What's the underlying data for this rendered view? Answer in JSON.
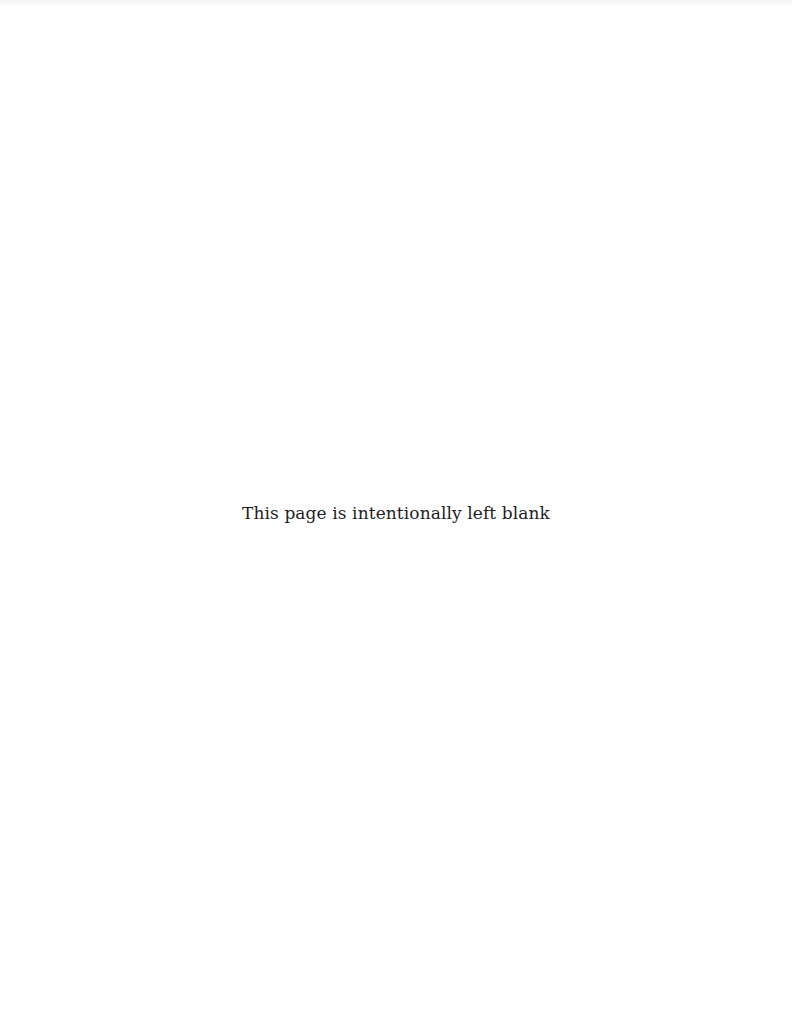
{
  "page": {
    "notice": "This page is intentionally left blank",
    "background_color": "#fefefe",
    "text_color": "#1e1e1e"
  }
}
